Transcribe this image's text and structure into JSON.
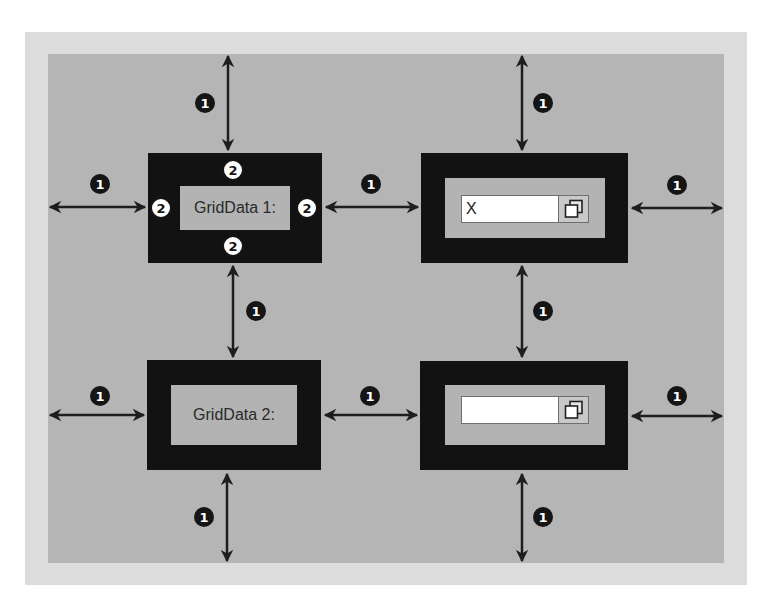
{
  "diagram": {
    "title": "",
    "colors": {
      "page": "#ffffff",
      "outer_border": "#dcdcdc",
      "grid_background": "#b5b5b5",
      "cell_border": "#121212",
      "cell_content": "#b3b3b3",
      "arrow": "#1e1e1e",
      "badge_dark": "#151515",
      "badge_light": "#ffffff"
    },
    "legend_badges": {
      "margin": "1",
      "padding": "2"
    },
    "cells": [
      {
        "id": "r1c1",
        "type": "label",
        "text": "GridData 1:",
        "padding_badges": [
          "2",
          "2",
          "2",
          "2"
        ]
      },
      {
        "id": "r1c2",
        "type": "input-with-button",
        "value": "X",
        "placeholder": "",
        "button_icon": "copy-icon"
      },
      {
        "id": "r2c1",
        "type": "label",
        "text": "GridData 2:"
      },
      {
        "id": "r2c2",
        "type": "input-with-button",
        "value": "",
        "placeholder": "",
        "button_icon": "copy-icon"
      }
    ],
    "margin_arrows": [
      {
        "id": "top-left",
        "badge": "1"
      },
      {
        "id": "top-right",
        "badge": "1"
      },
      {
        "id": "row1-left",
        "badge": "1"
      },
      {
        "id": "row1-middle",
        "badge": "1"
      },
      {
        "id": "row1-right",
        "badge": "1"
      },
      {
        "id": "middle-left",
        "badge": "1"
      },
      {
        "id": "middle-right",
        "badge": "1"
      },
      {
        "id": "row2-left",
        "badge": "1"
      },
      {
        "id": "row2-middle",
        "badge": "1"
      },
      {
        "id": "row2-right",
        "badge": "1"
      },
      {
        "id": "bottom-left",
        "badge": "1"
      },
      {
        "id": "bottom-right",
        "badge": "1"
      }
    ]
  }
}
